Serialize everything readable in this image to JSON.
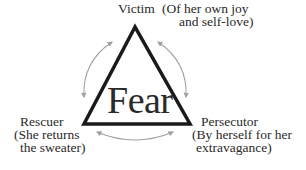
{
  "diagram": {
    "center_label": "Fear",
    "nodes": {
      "top": {
        "role": "Victim",
        "note_line1": "(Of her own joy",
        "note_line2": "and self-love)"
      },
      "left": {
        "role": "Rescuer",
        "note_line1": "(She returns",
        "note_line2": "the sweater)"
      },
      "right": {
        "role": "Persecutor",
        "note_line1": "(By herself for her",
        "note_line2": "extravagance)"
      }
    },
    "colors": {
      "triangle": "#1a1a1a",
      "arrows": "#a0a0a0",
      "text": "#2a2a2a"
    }
  }
}
